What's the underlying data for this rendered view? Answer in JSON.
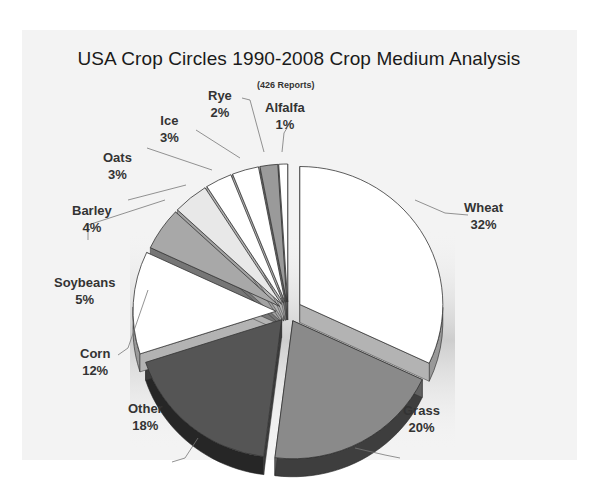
{
  "chart_data": {
    "type": "pie",
    "title": "USA Crop Circles 1990-2008 Crop Medium Analysis",
    "subtitle": "(426 Reports)",
    "style": "3d-exploded",
    "slices": [
      {
        "label": "Wheat",
        "value": 32,
        "pct_label": "32%",
        "color": "#ffffff"
      },
      {
        "label": "Grass",
        "value": 20,
        "pct_label": "20%",
        "color": "#8a8a8a"
      },
      {
        "label": "Other",
        "value": 18,
        "pct_label": "18%",
        "color": "#555555"
      },
      {
        "label": "Corn",
        "value": 12,
        "pct_label": "12%",
        "color": "#ffffff"
      },
      {
        "label": "Soybeans",
        "value": 5,
        "pct_label": "5%",
        "color": "#a8a8a8"
      },
      {
        "label": "Barley",
        "value": 4,
        "pct_label": "4%",
        "color": "#e8e8e8"
      },
      {
        "label": "Oats",
        "value": 3,
        "pct_label": "3%",
        "color": "#ffffff"
      },
      {
        "label": "Ice",
        "value": 3,
        "pct_label": "3%",
        "color": "#ffffff"
      },
      {
        "label": "Rye",
        "value": 2,
        "pct_label": "2%",
        "color": "#9a9a9a"
      },
      {
        "label": "Alfalfa",
        "value": 1,
        "pct_label": "1%",
        "color": "#ffffff"
      }
    ],
    "legend": "none (data labels with leader lines)"
  },
  "labels": {
    "wheat": {
      "name": "Wheat",
      "pct": "32%"
    },
    "grass": {
      "name": "Grass",
      "pct": "20%"
    },
    "other": {
      "name": "Other",
      "pct": "18%"
    },
    "corn": {
      "name": "Corn",
      "pct": "12%"
    },
    "soybeans": {
      "name": "Soybeans",
      "pct": "5%"
    },
    "barley": {
      "name": "Barley",
      "pct": "4%"
    },
    "oats": {
      "name": "Oats",
      "pct": "3%"
    },
    "ice": {
      "name": "Ice",
      "pct": "3%"
    },
    "rye": {
      "name": "Rye",
      "pct": "2%"
    },
    "alfalfa": {
      "name": "Alfalfa",
      "pct": "1%"
    }
  }
}
